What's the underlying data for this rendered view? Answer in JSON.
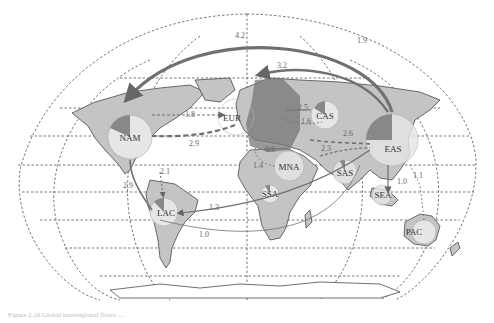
{
  "figure": {
    "type": "world flow map",
    "caption": "Figure 2.10 Global interregional flows ..."
  },
  "regions": [
    {
      "code": "NAM",
      "x": 130,
      "y": 137,
      "r": 22
    },
    {
      "code": "EUR",
      "x": 236,
      "y": 117,
      "r": 18
    },
    {
      "code": "CAS",
      "x": 325,
      "y": 115,
      "r": 14
    },
    {
      "code": "EAS",
      "x": 392,
      "y": 140,
      "r": 26
    },
    {
      "code": "MNA",
      "x": 289,
      "y": 166,
      "r": 15
    },
    {
      "code": "SAS",
      "x": 345,
      "y": 172,
      "r": 12
    },
    {
      "code": "SEA",
      "x": 382,
      "y": 195,
      "r": 10
    },
    {
      "code": "SSA",
      "x": 270,
      "y": 194,
      "r": 9
    },
    {
      "code": "LAC",
      "x": 164,
      "y": 212,
      "r": 14
    },
    {
      "code": "PAC",
      "x": 424,
      "y": 232,
      "r": 12
    }
  ],
  "flows": [
    {
      "from": "EAS",
      "to": "NAM",
      "value": "4.2"
    },
    {
      "from": "EAS",
      "to": "EUR",
      "value": "3.2"
    },
    {
      "from": "EAS",
      "to": "NAM",
      "value": "1.9",
      "note": "outer arc"
    },
    {
      "from": "NAM",
      "to": "EUR",
      "value": "1.8"
    },
    {
      "from": "EUR",
      "to": "NAM",
      "value": "2.9"
    },
    {
      "from": "NAM",
      "to": "LAC",
      "value": "2.9"
    },
    {
      "from": "NAM",
      "to": "LAC",
      "value": "2.1"
    },
    {
      "from": "EAS",
      "to": "LAC",
      "value": "1.3"
    },
    {
      "from": "SAS",
      "to": "LAC",
      "value": "1.0"
    },
    {
      "from": "CAS",
      "to": "EUR",
      "value": "2.5"
    },
    {
      "from": "EUR",
      "to": "CAS",
      "value": "1.6"
    },
    {
      "from": "MNA",
      "to": "EAS",
      "value": "2.6"
    },
    {
      "from": "MNA",
      "to": "EUR",
      "value": "1.4"
    },
    {
      "from": "EUR",
      "to": "MNA",
      "value": "0.9"
    },
    {
      "from": "SAS",
      "to": "EAS",
      "value": "2.3"
    },
    {
      "from": "PAC",
      "to": "EAS",
      "value": "1.1"
    },
    {
      "from": "EAS",
      "to": "SEA",
      "value": "1.0"
    }
  ],
  "colors": {
    "land": "#c4c4c4",
    "region_circle": "#e6e6e6",
    "pie_slice": "#8a8a8a",
    "eur_highlight": "#777777",
    "flow": "#707070",
    "graticule": "#555555"
  }
}
